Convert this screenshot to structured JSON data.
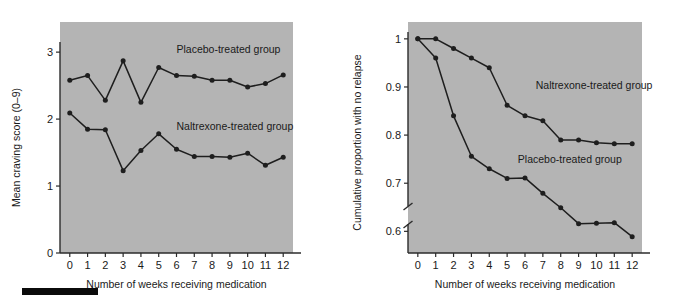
{
  "figure": {
    "background_color": "#ffffff",
    "plot_background_color": "#b4b4b4",
    "line_color": "#1e1e1e",
    "axis_color": "#2b2b2b",
    "marker_color": "#1e1e1e",
    "footer_bar_color": "#0b0b0b"
  },
  "chart_data": [
    {
      "type": "line",
      "title": "",
      "subtitle": "",
      "panel": "left",
      "xlabel": "Number of weeks receiving medication",
      "ylabel": "Mean craving score (0–9)",
      "x": [
        0,
        1,
        2,
        3,
        4,
        5,
        6,
        7,
        8,
        9,
        10,
        11,
        12
      ],
      "xticks": [
        "0",
        "1",
        "2",
        "3",
        "4",
        "5",
        "6",
        "7",
        "8",
        "9",
        "10",
        "11",
        "12"
      ],
      "yticks": [
        "0",
        "1",
        "2",
        "3"
      ],
      "ytickvalues": [
        0,
        1,
        2,
        3
      ],
      "xlim": [
        -0.55,
        12.55
      ],
      "ylim": [
        0,
        3.45
      ],
      "grid": false,
      "legend": "inline-annotations",
      "axis_break": false,
      "series": [
        {
          "name": "Placebo-treated group",
          "label_x": 6.0,
          "label_y": 2.98,
          "values": [
            2.58,
            2.65,
            2.28,
            2.87,
            2.25,
            2.77,
            2.65,
            2.64,
            2.58,
            2.58,
            2.48,
            2.53,
            2.66
          ]
        },
        {
          "name": "Naltrexone-treated group",
          "label_x": 6.0,
          "label_y": 1.83,
          "values": [
            2.09,
            1.85,
            1.84,
            1.23,
            1.53,
            1.78,
            1.55,
            1.44,
            1.44,
            1.43,
            1.49,
            1.31,
            1.43
          ]
        }
      ]
    },
    {
      "type": "line",
      "title": "",
      "subtitle": "",
      "panel": "right",
      "xlabel": "Number of weeks receiving medication",
      "ylabel": "Cumulative proportion with no relapse",
      "x": [
        0,
        1,
        2,
        3,
        4,
        5,
        6,
        7,
        8,
        9,
        10,
        11,
        12
      ],
      "xticks": [
        "0",
        "1",
        "2",
        "3",
        "4",
        "5",
        "6",
        "7",
        "8",
        "9",
        "10",
        "11",
        "12"
      ],
      "yticks": [
        "0.6",
        "0.7",
        "0.8",
        "0.9",
        "1"
      ],
      "ytickvalues": [
        0.6,
        0.7,
        0.8,
        0.9,
        1.0
      ],
      "xlim": [
        -0.55,
        12.55
      ],
      "ylim": [
        0.555,
        1.035
      ],
      "grid": false,
      "legend": "inline-annotations",
      "axis_break": true,
      "axis_break_note": "y-axis broken below 0.6",
      "series": [
        {
          "name": "Naltrexone-treated group",
          "label_x": 6.6,
          "label_y": 0.895,
          "values": [
            1.0,
            1.0,
            0.98,
            0.96,
            0.94,
            0.862,
            0.84,
            0.83,
            0.79,
            0.79,
            0.784,
            0.782,
            0.782
          ]
        },
        {
          "name": "Placebo-treated group",
          "label_x": 5.6,
          "label_y": 0.742,
          "values": [
            1.0,
            0.96,
            0.84,
            0.756,
            0.73,
            0.71,
            0.711,
            0.679,
            0.649,
            0.616,
            0.617,
            0.618,
            0.589
          ]
        }
      ]
    }
  ]
}
